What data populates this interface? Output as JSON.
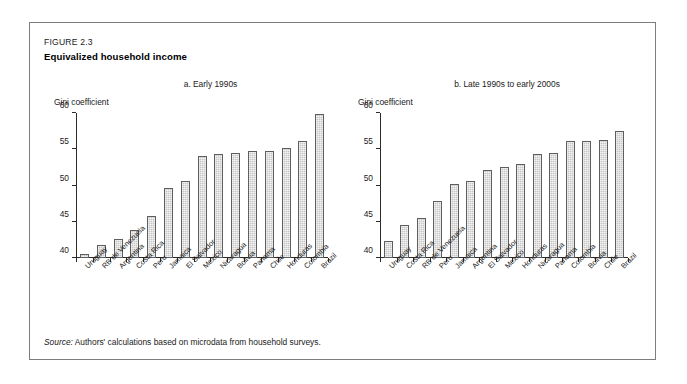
{
  "figure": {
    "number": "FIGURE 2.3",
    "title": "Equivalized household income",
    "source_label": "Source:",
    "source_text": "Authors' calculations based on microdata from household surveys."
  },
  "chart_data": [
    {
      "type": "bar",
      "panel_id": "a",
      "title": "a. Early 1990s",
      "ylabel": "Gini coefficient",
      "xlabel": "",
      "ylim": [
        40,
        60
      ],
      "yticks": [
        40,
        45,
        50,
        55,
        60
      ],
      "grid": false,
      "legend": "none",
      "categories": [
        "Uruguay",
        "RB de Venezuela",
        "Argentina",
        "Costa Rica",
        "Peru",
        "Jamaica",
        "El Salvador",
        "Mexico",
        "Nicaragua",
        "Bolivia",
        "Panama",
        "Chile",
        "Honduras",
        "Colombia",
        "Brazil"
      ],
      "values": [
        40.6,
        41.8,
        42.6,
        43.9,
        45.8,
        49.7,
        50.6,
        54.1,
        54.3,
        54.5,
        54.7,
        54.8,
        55.2,
        56.1,
        59.8
      ]
    },
    {
      "type": "bar",
      "panel_id": "b",
      "title": "b. Late 1990s to early 2000s",
      "ylabel": "Gini coefficient",
      "xlabel": "",
      "ylim": [
        40,
        60
      ],
      "yticks": [
        40,
        45,
        50,
        55,
        60
      ],
      "grid": false,
      "legend": "none",
      "categories": [
        "Uruguay",
        "Costa Rica",
        "RB de Venezuela",
        "Peru",
        "Jamaica",
        "Argentina",
        "El Salvador",
        "Mexico",
        "Honduras",
        "Nicaragua",
        "Panama",
        "Colombia",
        "Bolivia",
        "Chile",
        "Brazil"
      ],
      "values": [
        42.4,
        44.6,
        45.5,
        47.9,
        50.2,
        50.6,
        52.2,
        52.5,
        53.0,
        54.3,
        54.5,
        56.1,
        56.1,
        56.3,
        57.5
      ]
    }
  ],
  "style": {
    "bar_fill": "#c6c6c6",
    "bar_border": "#5e5e5e",
    "axis_color": "#2b2b2b",
    "frame_border": "#7d7d7d",
    "text_color": "#1a1a1a"
  }
}
